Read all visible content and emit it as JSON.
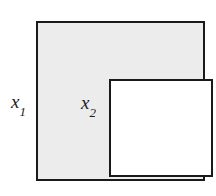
{
  "figure": {
    "type": "nested-squares-diagram",
    "background_color": "#ffffff",
    "outer_square": {
      "name": "outer-square",
      "fill_color": "#ececec",
      "stroke_color": "#1a1a1a",
      "stroke_width_px": 2,
      "x_px": 36,
      "y_px": 21,
      "width_px": 169,
      "height_px": 160
    },
    "inner_square": {
      "name": "inner-square",
      "fill_color": "#ffffff",
      "stroke_color": "#1a1a1a",
      "stroke_width_px": 2,
      "x_px": 71,
      "y_px": 56,
      "width_px": 104,
      "height_px": 98
    },
    "labels": {
      "outer_side": {
        "base": "x",
        "subscript": "1",
        "full_text": "x1",
        "position": "left-of-outer-square",
        "x_px": 11,
        "y_px": 92
      },
      "inner_side": {
        "base": "x",
        "subscript": "2",
        "full_text": "x2",
        "position": "inside-inner-square-upper-left",
        "x_px": 81,
        "y_px": 93
      }
    }
  }
}
